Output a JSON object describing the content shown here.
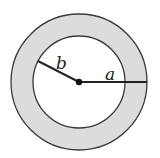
{
  "diagram": {
    "type": "annulus",
    "labels": {
      "outer_radius": "a",
      "inner_radius": "b"
    },
    "colors": {
      "ring_fill": "#dcdcdc",
      "inner_fill": "#ffffff",
      "stroke": "#333333"
    }
  }
}
